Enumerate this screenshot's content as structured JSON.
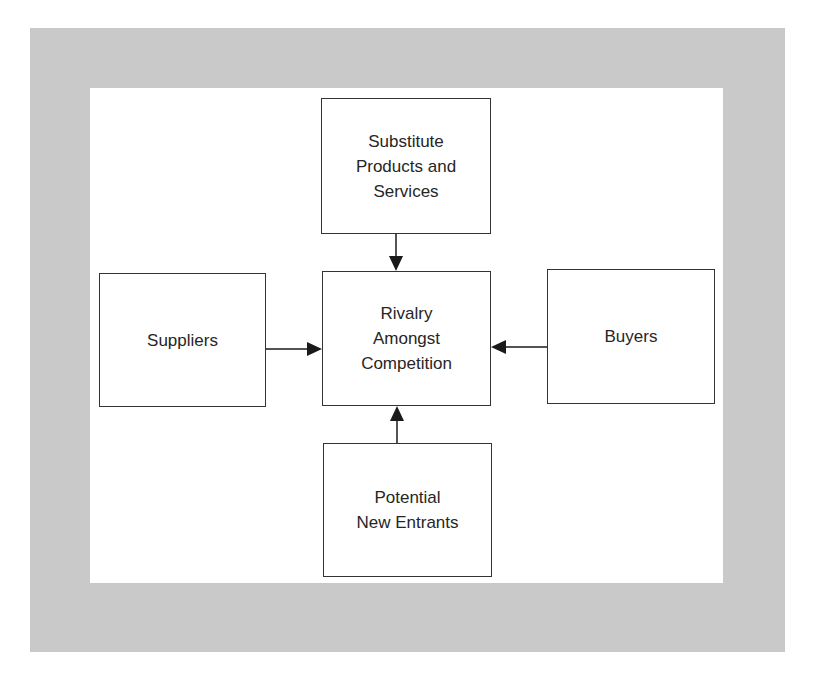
{
  "diagram": {
    "colors": {
      "frame": "#c9c9c9",
      "box_border": "#333333",
      "text": "#262626",
      "arrow": "#1a1a1a"
    },
    "nodes": {
      "top": {
        "lines": [
          "Substitute",
          "Products and",
          "Services"
        ]
      },
      "left": {
        "lines": [
          "Suppliers"
        ]
      },
      "center": {
        "lines": [
          "Rivalry",
          "Amongst",
          "Competition"
        ]
      },
      "right": {
        "lines": [
          "Buyers"
        ]
      },
      "bottom": {
        "lines": [
          "Potential",
          "New Entrants"
        ]
      }
    },
    "edges": [
      {
        "from": "top",
        "to": "center"
      },
      {
        "from": "left",
        "to": "center"
      },
      {
        "from": "right",
        "to": "center"
      },
      {
        "from": "bottom",
        "to": "center"
      }
    ]
  }
}
